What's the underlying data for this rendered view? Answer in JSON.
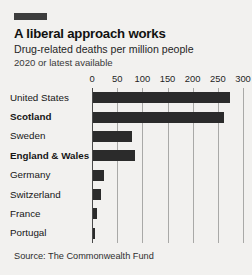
{
  "header": {
    "marker_color": "#3d3d3d",
    "title": "A liberal approach works",
    "subtitle": "Drug-related deaths per million people",
    "subsubtitle": "2020 or latest available"
  },
  "footer": {
    "source": "Source: The Commonwealth Fund"
  },
  "style": {
    "background": "#f2f1ef",
    "bar_color": "#2b2b2b",
    "grid_color": "#a9a9a7",
    "axis_color": "#4a4a4a"
  },
  "chart_data": {
    "type": "bar",
    "orientation": "horizontal",
    "title": "A liberal approach works",
    "subtitle": "Drug-related deaths per million people",
    "note": "2020 or latest available",
    "source": "Source: The Commonwealth Fund",
    "xlabel": "",
    "ylabel": "",
    "xlim": [
      0,
      300
    ],
    "xticks": [
      0,
      50,
      100,
      150,
      200,
      250,
      300
    ],
    "xtick_labels": [
      "0",
      "50",
      "100",
      "150",
      "200",
      "250",
      "300"
    ],
    "grid": true,
    "legend": false,
    "categories": [
      "United States",
      "Scotland",
      "Sweden",
      "England & Wales",
      "Germany",
      "Switzerland",
      "France",
      "Portugal"
    ],
    "emphasis": [
      false,
      true,
      false,
      true,
      false,
      false,
      false,
      false
    ],
    "values": [
      274,
      263,
      80,
      86,
      24,
      17,
      9,
      6
    ]
  }
}
